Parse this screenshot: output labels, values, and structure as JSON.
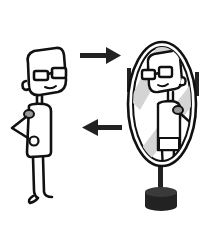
{
  "illustration": {
    "subject": "Cartoon person with glasses looking at own reflection in a standing oval mirror",
    "elements": {
      "person": "cartoon-figure-left",
      "arrow_top": "arrow-right",
      "arrow_bottom": "arrow-left",
      "mirror": "standing-oval-mirror",
      "reflection": "reflected-figure"
    },
    "colors": {
      "line": "#111111",
      "fill": "#ffffff",
      "accent_gray": "#9a9a9a",
      "glass_sheen": "#d4d4d4",
      "base": "#222222"
    }
  }
}
